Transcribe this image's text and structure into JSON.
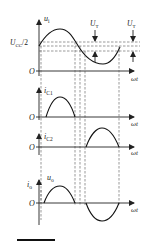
{
  "figure": {
    "type": "waveform-timing-diagram",
    "panels": [
      {
        "id": "input",
        "ylabel": "u",
        "ylabel_sub": "i",
        "xlabel": "ωt",
        "origin": "O",
        "level_label": "U",
        "level_label_sub": "CC",
        "level_label_suffix": "/2",
        "threshold_label": "U",
        "threshold_label_sub": "T"
      },
      {
        "id": "ic1",
        "ylabel": "i",
        "ylabel_sub": "C1",
        "xlabel": "ωt",
        "origin": "O"
      },
      {
        "id": "ic2",
        "ylabel": "i",
        "ylabel_sub": "C2",
        "xlabel": "ωt",
        "origin": "O"
      },
      {
        "id": "output",
        "ylabel": "i",
        "ylabel_sub": "o",
        "ylabel2": "u",
        "ylabel2_sub": "o",
        "xlabel": "ωt",
        "origin": "O"
      }
    ]
  },
  "colors": {
    "ink": "#111111",
    "dash": "#555555",
    "background": "#ffffff"
  }
}
